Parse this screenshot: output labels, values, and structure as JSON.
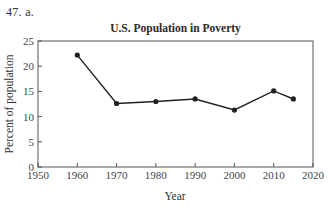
{
  "problem": {
    "label": "47.  a."
  },
  "chart_data": {
    "type": "line",
    "title": "U.S. Population in Poverty",
    "xlabel": "Year",
    "ylabel": "Percent of population",
    "x": [
      1960,
      1970,
      1980,
      1990,
      2000,
      2010,
      2015
    ],
    "series": [
      {
        "name": "Percent of population in poverty",
        "values": [
          22.2,
          12.6,
          13.0,
          13.5,
          11.3,
          15.1,
          13.5
        ]
      }
    ],
    "xlim": [
      1950,
      2020
    ],
    "ylim": [
      0,
      25
    ],
    "xticks": [
      1950,
      1960,
      1970,
      1980,
      1990,
      2000,
      2010,
      2020
    ],
    "yticks": [
      0,
      5,
      10,
      15,
      20,
      25
    ],
    "grid": false,
    "legend": "none",
    "markers": "filled-circle",
    "line_color": "#222222"
  }
}
